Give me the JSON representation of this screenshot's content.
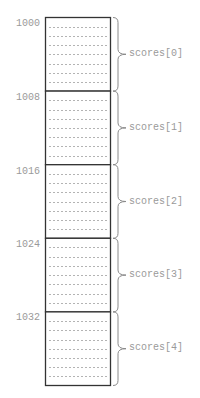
{
  "diagram": {
    "type": "memory-layout",
    "array_name": "scores",
    "bytes_per_element": 8,
    "dotted_rows_per_block": 7,
    "colors": {
      "box_border": "#333333",
      "dots": "#555555",
      "label_text": "#9a9a9a",
      "brace": "#8a8a8a"
    },
    "blocks": [
      {
        "address": "1000",
        "label": "scores[0]"
      },
      {
        "address": "1008",
        "label": "scores[1]"
      },
      {
        "address": "1016",
        "label": "scores[2]"
      },
      {
        "address": "1024",
        "label": "scores[3]"
      },
      {
        "address": "1032",
        "label": "scores[4]"
      }
    ]
  }
}
